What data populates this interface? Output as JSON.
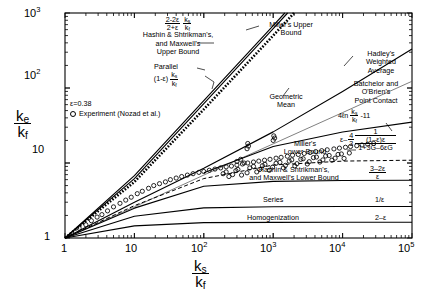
{
  "chart_data": {
    "type": "line",
    "title": "",
    "xlabel": "k_s / k_f",
    "ylabel": "k_e / k_f",
    "xscale": "log",
    "yscale": "log",
    "xlim": [
      1,
      100000
    ],
    "ylim": [
      1,
      1000
    ],
    "grid": false,
    "xticks": [
      "1",
      "10",
      "10^2",
      "10^3",
      "10^4",
      "10^5"
    ],
    "yticks": [
      "1",
      "10",
      "10^2",
      "10^3"
    ],
    "porosity_label": "ε=0.38",
    "porosity_value": 0.38,
    "legend": {
      "marker": "open-circle",
      "label": "Experiment (Nozad et al.)"
    },
    "series": [
      {
        "name": "Hashin & Shtrikman's, and Maxwell's Upper Bound",
        "formula": "(2-2ε)/(2+ε) · k_s/k_f",
        "style": "solid",
        "x": [
          1,
          10,
          100,
          1000,
          10000,
          100000
        ],
        "y": [
          1,
          6.8,
          68,
          680,
          6800,
          68000
        ]
      },
      {
        "name": "Parallel",
        "formula": "(1-ε) k_s/k_f",
        "style": "solid",
        "x": [
          1,
          10,
          100,
          1000,
          10000,
          100000
        ],
        "y": [
          1,
          6.2,
          62,
          620,
          6200,
          62000
        ]
      },
      {
        "name": "Miller's Upper Bound",
        "style": "dashed-thick",
        "x": [
          1,
          10,
          100,
          1000,
          10000
        ],
        "y": [
          1,
          5.6,
          52,
          500,
          5000
        ]
      },
      {
        "name": "Geometric Mean",
        "formula": "(k_s/k_f)^(1-ε)",
        "style": "solid-thin",
        "x": [
          1,
          10,
          100,
          1000,
          10000,
          100000
        ],
        "y": [
          1,
          2.6,
          6.9,
          18,
          47,
          123
        ]
      },
      {
        "name": "Hadley's Weighted Average",
        "style": "solid",
        "x": [
          1,
          10,
          100,
          1000,
          10000,
          100000
        ],
        "y": [
          1,
          3.0,
          8.5,
          26,
          90,
          330
        ]
      },
      {
        "name": "Batchelor and O'Brien's Point Contact",
        "formula": "4ℓn(k_s/k_f) - 11",
        "style": "solid",
        "x": [
          100,
          1000,
          10000,
          100000
        ],
        "y": [
          7.4,
          16.6,
          25.9,
          35.1
        ]
      },
      {
        "name": "Miller's Lower Bound",
        "style": "dashed",
        "x": [
          1,
          10,
          100,
          1000,
          10000,
          100000
        ],
        "y": [
          1,
          2.7,
          6.2,
          9.4,
          10.6,
          10.9
        ]
      },
      {
        "name": "Hashin & Shtrikman's, and Maxwell's Lower Bound",
        "formula": "(3-2ε)/ε",
        "style": "solid",
        "x": [
          1,
          10,
          100,
          1000,
          10000,
          100000
        ],
        "y": [
          1,
          2.5,
          4.9,
          5.7,
          5.85,
          5.89
        ]
      },
      {
        "name": "Series",
        "formula": "1/ε",
        "style": "solid",
        "x": [
          1,
          10,
          100,
          1000,
          10000,
          100000
        ],
        "y": [
          1,
          1.95,
          2.52,
          2.61,
          2.63,
          2.632
        ]
      },
      {
        "name": "Homogenization",
        "formula": "2-ε",
        "style": "solid",
        "x": [
          1,
          10,
          100,
          1000,
          10000,
          100000
        ],
        "y": [
          1,
          1.45,
          1.6,
          1.618,
          1.62,
          1.62
        ]
      }
    ],
    "experiment_points": [
      [
        1.6,
        1.35
      ],
      [
        2.0,
        1.5
      ],
      [
        2.4,
        1.7
      ],
      [
        2.9,
        1.9
      ],
      [
        3.4,
        2.05
      ],
      [
        4.1,
        2.3
      ],
      [
        5.0,
        2.6
      ],
      [
        6.2,
        2.9
      ],
      [
        7.5,
        3.2
      ],
      [
        9.0,
        3.5
      ],
      [
        11,
        3.9
      ],
      [
        13,
        4.2
      ],
      [
        16,
        4.6
      ],
      [
        19,
        5.0
      ],
      [
        23,
        5.3
      ],
      [
        28,
        5.6
      ],
      [
        33,
        6.0
      ],
      [
        40,
        6.3
      ],
      [
        48,
        6.6
      ],
      [
        58,
        6.9
      ],
      [
        70,
        7.2
      ],
      [
        85,
        7.5
      ],
      [
        100,
        7.7
      ],
      [
        120,
        8.0
      ],
      [
        145,
        8.3
      ],
      [
        175,
        8.6
      ],
      [
        210,
        8.9
      ],
      [
        250,
        9.1
      ],
      [
        300,
        9.4
      ],
      [
        360,
        9.7
      ],
      [
        430,
        10.0
      ],
      [
        520,
        10.3
      ],
      [
        620,
        10.6
      ],
      [
        750,
        10.9
      ],
      [
        900,
        11.2
      ],
      [
        1100,
        11.6
      ],
      [
        1300,
        11.9
      ],
      [
        1600,
        12.3
      ],
      [
        1900,
        12.7
      ],
      [
        2300,
        13.0
      ],
      [
        2800,
        13.4
      ],
      [
        3400,
        13.8
      ],
      [
        4100,
        14.2
      ],
      [
        5000,
        14.6
      ],
      [
        6000,
        15.0
      ],
      [
        7500,
        15.4
      ],
      [
        9000,
        15.8
      ],
      [
        11000,
        16.2
      ],
      [
        13000,
        16.6
      ],
      [
        16000,
        17.0
      ],
      [
        19000,
        17.4
      ],
      [
        23000,
        17.8
      ],
      [
        28000,
        18.2
      ],
      [
        190,
        7.2
      ],
      [
        210,
        7.6
      ],
      [
        260,
        7.0
      ],
      [
        310,
        8.2
      ],
      [
        420,
        7.4
      ],
      [
        520,
        9.0
      ],
      [
        640,
        8.2
      ],
      [
        760,
        9.6
      ],
      [
        980,
        8.8
      ],
      [
        1250,
        10.2
      ],
      [
        1500,
        9.3
      ],
      [
        1850,
        11.0
      ],
      [
        2200,
        9.8
      ],
      [
        2700,
        11.4
      ],
      [
        3300,
        10.4
      ],
      [
        4200,
        12.0
      ],
      [
        5200,
        11.0
      ],
      [
        6400,
        12.6
      ],
      [
        7800,
        11.6
      ],
      [
        9600,
        13.2
      ],
      [
        230,
        6.6
      ],
      [
        290,
        7.9
      ],
      [
        350,
        6.9
      ],
      [
        460,
        8.6
      ],
      [
        580,
        7.6
      ],
      [
        700,
        9.2
      ],
      [
        880,
        8.0
      ],
      [
        1100,
        9.9
      ],
      [
        1400,
        8.6
      ],
      [
        1700,
        10.6
      ],
      [
        2050,
        9.1
      ],
      [
        2500,
        11.2
      ],
      [
        3100,
        9.7
      ],
      [
        3800,
        11.8
      ],
      [
        4700,
        10.3
      ],
      [
        5700,
        12.4
      ],
      [
        7000,
        10.9
      ],
      [
        8600,
        13.0
      ],
      [
        10500,
        11.5
      ],
      [
        12500,
        13.6
      ],
      [
        1000,
        20.0
      ],
      [
        1050,
        21.5
      ],
      [
        1020,
        23.0
      ],
      [
        420,
        15.5
      ],
      [
        440,
        16.8
      ],
      [
        430,
        18.2
      ],
      [
        300,
        10.5
      ],
      [
        340,
        11.2
      ],
      [
        380,
        10.0
      ]
    ]
  },
  "annotations": {
    "hs_upper": {
      "formula_num": "2-2ε",
      "formula_den": "2+ε",
      "frac2_num": "k",
      "frac2_num_sub": "s",
      "frac2_den": "k",
      "frac2_den_sub": "f",
      "line1": "Hashin & Shtrikman's,",
      "line2": "and Maxwell's",
      "line3": "Upper Bound"
    },
    "parallel": {
      "title": "Parallel",
      "prefix": "(1-ε)"
    },
    "millers_upper": {
      "line1": "Miller's Upper",
      "line2": "Bound"
    },
    "geometric_mean": {
      "line1": "Geometric",
      "line2": "Mean"
    },
    "hadley": {
      "line1": "Hadley's",
      "line2": "Weighted",
      "line3": "Average"
    },
    "batchelor": {
      "line1": "Batchelor and",
      "line2": "O'Brien's",
      "line3": "Point Contact",
      "formula_prefix": "4ℓn",
      "formula_suffix": "-11"
    },
    "millers_lower": {
      "line1": "Miller's",
      "line2": "Lower Bound",
      "formula_eps": "ε–",
      "formula_frac_num": "4",
      "formula_frac_den": "3",
      "formula_top": "1",
      "formula_mid": "(1–ε)ε",
      "formula_bot": "1+3G–6εG"
    },
    "hs_lower": {
      "line1": "Hashin & Shtrikman's,",
      "line2": "and Maxwell's Lower Bound",
      "formula_num": "3–2ε",
      "formula_den": "ε"
    },
    "series": {
      "label": "Series",
      "formula": "1/ε"
    },
    "homogenization": {
      "label": "Homogenization",
      "formula": "2–ε"
    }
  },
  "axis": {
    "y_num": "k",
    "y_num_sub": "e",
    "y_den": "k",
    "y_den_sub": "f",
    "x_num": "k",
    "x_num_sub": "s",
    "x_den": "k",
    "x_den_sub": "f"
  },
  "colors": {
    "line": "#000000",
    "thin_line": "#555555",
    "background": "#ffffff"
  }
}
